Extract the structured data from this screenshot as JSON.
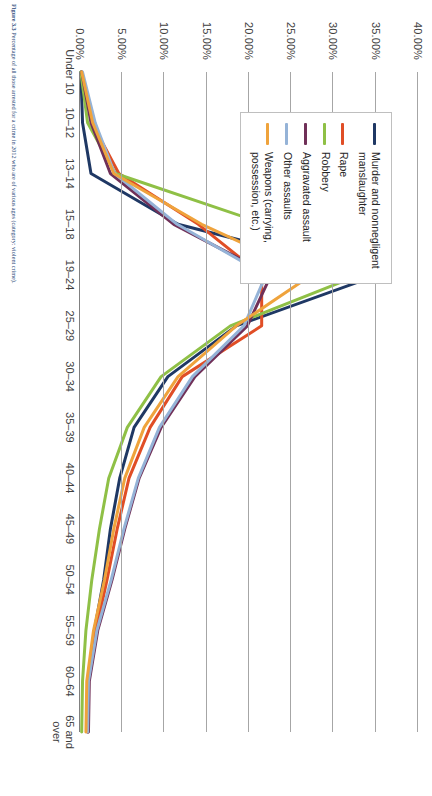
{
  "figure": {
    "caption_label": "Figure 3.3",
    "caption_text": "Percentage of all those arrested for a crime in 2012 who are of various ages (category: violent crime)."
  },
  "legend": {
    "items": [
      {
        "label": "Murder and nonnegligent manslaughter",
        "color": "#1F3864"
      },
      {
        "label": "Rape",
        "color": "#E04E26"
      },
      {
        "label": "Robbery",
        "color": "#8FC046"
      },
      {
        "label": "Aggravated assault",
        "color": "#703058"
      },
      {
        "label": "Other assaults",
        "color": "#95B3D7"
      },
      {
        "label": "Weapons (carrying, possession, etc.)",
        "color": "#EFA council"
      }
    ]
  },
  "chart_data": {
    "type": "line",
    "title": "",
    "xlabel": "",
    "ylabel": "",
    "ylim": [
      0,
      40
    ],
    "ytick_values": [
      0,
      5,
      10,
      15,
      20,
      25,
      30,
      35,
      40
    ],
    "ytick_labels": [
      "0.00%",
      "5.00%",
      "10.00%",
      "15.00%",
      "20.00%",
      "25.00%",
      "30.00%",
      "35.00%",
      "40.00%"
    ],
    "grid": true,
    "legend_position": "upper-right",
    "categories": [
      "Under 10",
      "10–12",
      "13–14",
      "15–18",
      "19–24",
      "25–29",
      "30–34",
      "35–39",
      "40–44",
      "45–49",
      "50–54",
      "55–59",
      "60–64",
      "65 and over"
    ],
    "series": [
      {
        "name": "Murder and nonnegligent manslaughter",
        "color": "#1F3864",
        "values": [
          0.1,
          0.3,
          1.3,
          11.6,
          35.2,
          18.5,
          10.4,
          6.4,
          4.7,
          3.6,
          2.8,
          1.7,
          1.0,
          0.9
        ]
      },
      {
        "name": "Rape",
        "color": "#E04E26",
        "values": [
          0.2,
          1.4,
          4.6,
          14.0,
          21.5,
          21.5,
          12.1,
          8.3,
          5.8,
          4.4,
          3.2,
          1.9,
          0.9,
          0.9
        ]
      },
      {
        "name": "Robbery",
        "color": "#8FC046",
        "values": [
          0.1,
          0.9,
          4.2,
          22.0,
          33.0,
          17.8,
          9.6,
          5.6,
          3.4,
          2.3,
          1.4,
          0.7,
          0.3,
          0.2
        ]
      },
      {
        "name": "Aggravated assault",
        "color": "#703058",
        "values": [
          0.2,
          1.3,
          3.6,
          11.1,
          22.6,
          19.8,
          13.6,
          9.6,
          7.0,
          5.3,
          3.8,
          2.1,
          1.1,
          1.0
        ]
      },
      {
        "name": "Other assaults",
        "color": "#95B3D7",
        "values": [
          0.3,
          1.8,
          4.1,
          11.5,
          22.0,
          19.4,
          13.3,
          9.4,
          6.9,
          5.2,
          3.7,
          2.0,
          1.0,
          0.9
        ]
      },
      {
        "name": "Weapons (carrying, possession, etc.)",
        "color": "#EFA33C",
        "values": [
          0.2,
          1.5,
          4.0,
          14.4,
          27.4,
          18.5,
          11.6,
          7.6,
          5.3,
          4.0,
          2.9,
          1.6,
          0.8,
          0.7
        ]
      }
    ]
  }
}
